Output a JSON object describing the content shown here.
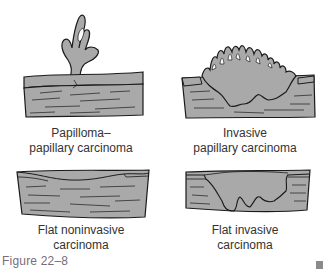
{
  "figure": {
    "caption": "Figure 22–8",
    "colors": {
      "tissue_fill": "#a9a9a9",
      "outline": "#1a1a1a",
      "caption_color": "#7a6c7a",
      "background": "#ffffff"
    },
    "panels": [
      {
        "id": "papilloma",
        "label_line1": "Papilloma–",
        "label_line2": "papillary carcinoma"
      },
      {
        "id": "invasive-papillary",
        "label_line1": "Invasive",
        "label_line2": "papillary carcinoma"
      },
      {
        "id": "flat-noninvasive",
        "label_line1": "Flat noninvasive",
        "label_line2": "carcinoma"
      },
      {
        "id": "flat-invasive",
        "label_line1": "Flat invasive",
        "label_line2": "carcinoma"
      }
    ]
  }
}
